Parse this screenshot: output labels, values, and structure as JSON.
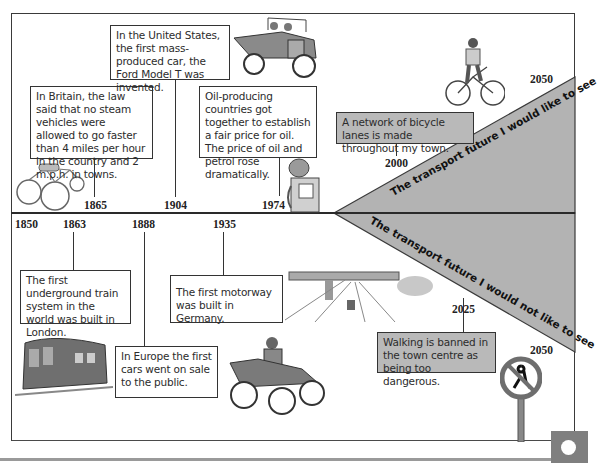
{
  "timeline": {
    "start_year": "1850",
    "colors": {
      "frame": "#3a3a3a",
      "triangle_fill": "#b3b3b3",
      "gray_box": "#b9b9b9",
      "corner_badge": "#7f7f7f"
    },
    "upper_events": [
      {
        "year": "1865",
        "text": "In Britain, the law said that no steam vehicles were allowed to go faster than 4 miles per hour in the country and 2 m.p.h. in towns."
      },
      {
        "year": "1904",
        "text": "In the United States, the first mass-produced car, the Ford Model T was invented."
      },
      {
        "year": "1974",
        "text": "Oil-producing countries got together to establish a fair price for oil. The price of oil and petrol rose dramatically."
      }
    ],
    "lower_events": [
      {
        "year": "1863",
        "text": "The first underground train system in the world was built in London."
      },
      {
        "year": "1888",
        "text": "In Europe the first cars went on sale to the public."
      },
      {
        "year": "1935",
        "text": "The first motorway was built in Germany."
      }
    ],
    "future_good": {
      "label": "The transport future I would like to see",
      "event_year": "2000",
      "event_text": "A network of bicycle lanes is made throughout my town.",
      "end_year": "2050"
    },
    "future_bad": {
      "label": "The transport future I would not like to see",
      "event_year": "2025",
      "event_text": "Walking is banned in the town centre as being too dangerous.",
      "end_year": "2050"
    },
    "illustrations": [
      "steam-tricycle",
      "ford-model-t",
      "petrol-pump",
      "cyclist",
      "underground-train-carriage",
      "early-motor-car",
      "motorway-bridge",
      "no-pedestrians-sign"
    ]
  }
}
